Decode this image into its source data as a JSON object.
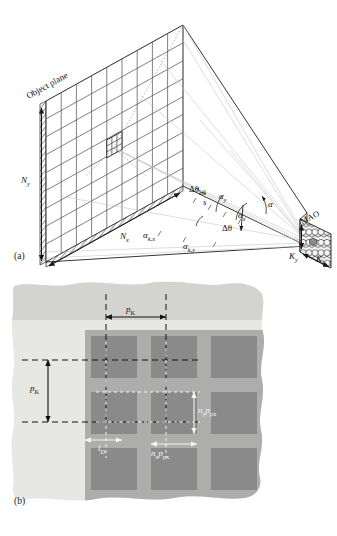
{
  "figure": {
    "panels": [
      {
        "id": "a",
        "caption": "(a)"
      },
      {
        "id": "b",
        "caption": "(b)"
      }
    ]
  },
  "panel_a": {
    "caption": "(a)",
    "object_plane_label": "Object plane",
    "mao_label": "MAO",
    "labels": {
      "n_y": {
        "base": "N",
        "sub": "y"
      },
      "n_x": {
        "base": "N",
        "sub": "x"
      },
      "k_y": {
        "base": "K",
        "sub": "y"
      },
      "k_x": {
        "base": "K",
        "sub": "x"
      },
      "alpha": {
        "base": "α",
        "sub": ""
      },
      "alpha_x": {
        "base": "α",
        "sub": "x"
      },
      "alpha_y": {
        "base": "α",
        "sub": "y"
      },
      "alpha_kx": {
        "base": "α",
        "sub": "k,x"
      },
      "alpha_ky": {
        "base": "α",
        "sub": "k,y"
      },
      "delta_theta": {
        "base": "Δθ",
        "sub": ""
      },
      "delta_theta_eff": {
        "base": "Δθ",
        "sub": "eff"
      },
      "s": {
        "base": "s",
        "sub": ""
      }
    },
    "grid": {
      "cols": 9,
      "rows": 9,
      "highlight_subgrid": 3
    }
  },
  "panel_b": {
    "caption": "(b)",
    "labels": {
      "p_k_horizontal": {
        "base": "p",
        "sub": "K"
      },
      "p_k_vertical": {
        "base": "p",
        "sub": "K"
      },
      "n_y_p_px": {
        "base": "n",
        "sub": "y",
        "base2": "p",
        "sub2": "px"
      },
      "n_x_p_px": {
        "base": "n",
        "sub": "x",
        "base2": "p",
        "sub2": "px"
      },
      "l_d": {
        "base": "l",
        "sub": "D"
      }
    },
    "layout": {
      "pixel_cols": 3,
      "pixel_rows": 3
    }
  },
  "colors": {
    "line": "#1a1a1a",
    "ray": "#b9b9b9",
    "paper": "#ffffff",
    "substrate_light": "#e2e2df",
    "substrate_mid": "#cfcfcc",
    "band_top": "#d2d2cf",
    "pixel_dark": "#8d8d8d",
    "pixel_gap": "#adadad",
    "dashed_black": "#121212",
    "dashed_white": "#f4f4f4",
    "honeycomb": "#f2f2f2",
    "honeycomb_hi": "#8c8c8c"
  }
}
